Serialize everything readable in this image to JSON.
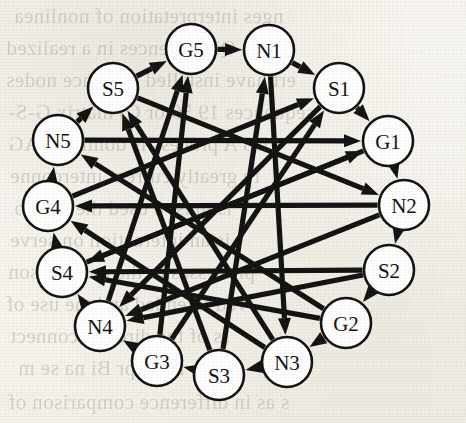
{
  "figure": {
    "type": "directed-graph",
    "background_color": "#fbfaf7",
    "stroke_color": "#111111",
    "node_fill_color": "#ffffff",
    "width": 466,
    "height": 423
  },
  "graph": {
    "layout": "circular",
    "center": {
      "x": 233,
      "y": 206
    },
    "radius": 158,
    "node_radius": 25,
    "node_count": 15,
    "nodes": [
      {
        "id": "G5",
        "label": "G5",
        "x": 191,
        "y": 49
      },
      {
        "id": "N1",
        "label": "N1",
        "x": 269,
        "y": 50
      },
      {
        "id": "S1",
        "label": "S1",
        "x": 339,
        "y": 88
      },
      {
        "id": "G1",
        "label": "G1",
        "x": 388,
        "y": 141
      },
      {
        "id": "N2",
        "label": "N2",
        "x": 404,
        "y": 205
      },
      {
        "id": "S2",
        "label": "S2",
        "x": 389,
        "y": 270
      },
      {
        "id": "G2",
        "label": "G2",
        "x": 346,
        "y": 323
      },
      {
        "id": "N3",
        "label": "N3",
        "x": 287,
        "y": 362
      },
      {
        "id": "S3",
        "label": "S3",
        "x": 219,
        "y": 375
      },
      {
        "id": "G3",
        "label": "G3",
        "x": 157,
        "y": 361
      },
      {
        "id": "N4",
        "label": "N4",
        "x": 100,
        "y": 326
      },
      {
        "id": "S4",
        "label": "S4",
        "x": 62,
        "y": 272
      },
      {
        "id": "G4",
        "label": "G4",
        "x": 48,
        "y": 206
      },
      {
        "id": "N5",
        "label": "N5",
        "x": 58,
        "y": 140
      },
      {
        "id": "S5",
        "label": "S5",
        "x": 113,
        "y": 88
      }
    ],
    "ring_edges": [
      {
        "from": "G5",
        "to": "N1"
      },
      {
        "from": "N1",
        "to": "S1"
      },
      {
        "from": "S1",
        "to": "G1"
      },
      {
        "from": "G1",
        "to": "N2"
      },
      {
        "from": "N2",
        "to": "S2"
      },
      {
        "from": "S2",
        "to": "G2"
      },
      {
        "from": "G2",
        "to": "N3"
      },
      {
        "from": "N3",
        "to": "S3"
      },
      {
        "from": "S3",
        "to": "G3"
      },
      {
        "from": "G3",
        "to": "N4"
      },
      {
        "from": "N4",
        "to": "S4"
      },
      {
        "from": "S4",
        "to": "G4"
      },
      {
        "from": "G4",
        "to": "N5"
      },
      {
        "from": "N5",
        "to": "S5"
      },
      {
        "from": "S5",
        "to": "G5"
      }
    ],
    "chord_edges": [
      {
        "from": "N5",
        "to": "G1"
      },
      {
        "from": "S5",
        "to": "N2"
      },
      {
        "from": "N1",
        "to": "N3"
      },
      {
        "from": "S1",
        "to": "N4"
      },
      {
        "from": "G1",
        "to": "S4"
      },
      {
        "from": "N2",
        "to": "G4"
      },
      {
        "from": "S2",
        "to": "S4"
      },
      {
        "from": "G2",
        "to": "N5"
      },
      {
        "from": "N3",
        "to": "S5"
      },
      {
        "from": "S3",
        "to": "N1"
      },
      {
        "from": "G3",
        "to": "S1"
      },
      {
        "from": "N4",
        "to": "G5"
      },
      {
        "from": "S4",
        "to": "G1"
      },
      {
        "from": "G4",
        "to": "S1"
      },
      {
        "from": "S3",
        "to": "S5"
      },
      {
        "from": "G3",
        "to": "G5"
      },
      {
        "from": "N3",
        "to": "G4"
      },
      {
        "from": "G2",
        "to": "S4"
      },
      {
        "from": "S2",
        "to": "N4"
      },
      {
        "from": "N2",
        "to": "N4"
      }
    ]
  },
  "bleed_text": {
    "note": "Faint mirrored show-through text from the reverse page of the scan",
    "lines": [
      {
        "text": "nges  interpretation of  nonlinea",
        "x": 14,
        "y": 4,
        "size": 21
      },
      {
        "text": "A Ni-Qi sequences in a  realized",
        "x": 6,
        "y": 36,
        "size": 21
      },
      {
        "text": "ert  have  installed interface  nodes",
        "x": 6,
        "y": 68,
        "size": 21
      },
      {
        "text": "sequences 19 59 or C) matrix  G-S-",
        "x": 8,
        "y": 100,
        "size": 21
      },
      {
        "text": "D5  A  process  is  dominant  AG",
        "x": 8,
        "y": 132,
        "size": 21
      },
      {
        "text": "re  greatly  current  interconne",
        "x": 10,
        "y": 164,
        "size": 21
      },
      {
        "text": "is  must  a  used  the  contro",
        "x": 14,
        "y": 196,
        "size": 21
      },
      {
        "text": "is  an  interaction  on  serve",
        "x": 10,
        "y": 228,
        "size": 21
      },
      {
        "text": "processes  in  the  comparison",
        "x": 8,
        "y": 260,
        "size": 21
      },
      {
        "text": "ved  intended  and  the  use  of",
        "x": 6,
        "y": 292,
        "size": 21
      },
      {
        "text": "rs  of  the  directly  connect",
        "x": 10,
        "y": 324,
        "size": 21
      },
      {
        "text": "nc  in  pr  Bi  na  se  m",
        "x": 18,
        "y": 356,
        "size": 21
      },
      {
        "text": "s  as  in  difference  comparison  of",
        "x": 8,
        "y": 390,
        "size": 21
      }
    ]
  }
}
